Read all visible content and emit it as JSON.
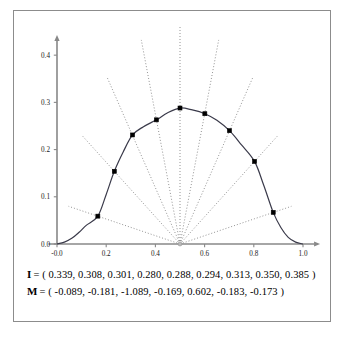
{
  "figure": {
    "background_color": "#ffffff",
    "border_color": "#8c8c8c"
  },
  "caption": {
    "line1_name": "I",
    "line1_eq": "= ( 0.339, 0.308, 0.301, 0.280, 0.288, 0.294, 0.313, 0.350, 0.385 )",
    "line2_name": "M",
    "line2_eq": "= ( -0.089, -0.181, -1.089, -0.169, 0.602, -0.183, -0.173 )"
  },
  "chart_data": {
    "type": "line",
    "title": "",
    "xlabel": "",
    "ylabel": "",
    "xlim": [
      -0.04,
      1.04
    ],
    "ylim": [
      0.0,
      0.43
    ],
    "grid": false,
    "legend": "none",
    "x_tick_labels": [
      "-0.0",
      "0.2",
      "0.4",
      "0.6",
      "0.8",
      "1.0"
    ],
    "x_tick_values": [
      0.0,
      0.2,
      0.4,
      0.6,
      0.8,
      1.0
    ],
    "y_tick_labels": [
      "0.0",
      "0.1",
      "0.2",
      "0.3",
      "0.4"
    ],
    "y_tick_values": [
      0.0,
      0.1,
      0.2,
      0.3,
      0.4
    ],
    "curve_color": "#3a3a4a",
    "marker_color": "#000000",
    "ray_color": "#777777",
    "axis_color": "#888888",
    "ray_origin": [
      0.5,
      0.0
    ],
    "ray_angles_deg": [
      170,
      150,
      130,
      110,
      90,
      70,
      50,
      30,
      10
    ],
    "radii": [
      0.339,
      0.308,
      0.301,
      0.28,
      0.288,
      0.294,
      0.313,
      0.35,
      0.385
    ],
    "ray_length": 0.46,
    "markers_x": [
      0.166,
      0.233,
      0.307,
      0.404,
      0.5,
      0.601,
      0.701,
      0.803,
      0.879
    ],
    "markers_y": [
      0.059,
      0.154,
      0.231,
      0.263,
      0.288,
      0.276,
      0.24,
      0.175,
      0.067
    ],
    "curve_x": [
      0.0,
      0.03,
      0.06,
      0.09,
      0.12,
      0.166,
      0.2,
      0.233,
      0.27,
      0.307,
      0.35,
      0.404,
      0.45,
      0.5,
      0.55,
      0.601,
      0.65,
      0.701,
      0.75,
      0.803,
      0.84,
      0.879,
      0.91,
      0.94,
      0.97,
      1.0
    ],
    "curve_y": [
      0.0,
      0.004,
      0.012,
      0.025,
      0.04,
      0.059,
      0.105,
      0.154,
      0.196,
      0.231,
      0.248,
      0.263,
      0.278,
      0.288,
      0.284,
      0.276,
      0.262,
      0.24,
      0.21,
      0.175,
      0.125,
      0.067,
      0.035,
      0.014,
      0.004,
      0.0
    ]
  }
}
